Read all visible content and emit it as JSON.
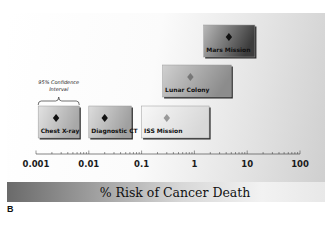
{
  "chart_data": {
    "type": "range-plot",
    "title": "% Risk of Cancer Death",
    "xlabel": "% Risk of Cancer Death",
    "ylabel": "",
    "xscale": "log",
    "xlim": [
      0.001,
      100
    ],
    "xticks": [
      {
        "value": 0.001,
        "label": "0.001"
      },
      {
        "value": 0.01,
        "label": "0.01"
      },
      {
        "value": 0.1,
        "label": "0.1"
      },
      {
        "value": 1,
        "label": "1"
      },
      {
        "value": 10,
        "label": "10"
      },
      {
        "value": 100,
        "label": "100"
      }
    ],
    "grid": false,
    "annotation": {
      "text_line1": "95% Confidence",
      "text_line2": "Interval",
      "applies_to": "Chest X-ray"
    },
    "series": [
      {
        "name": "Chest X-ray",
        "estimate": 0.0024,
        "ci_low": 0.0011,
        "ci_high": 0.0066,
        "row": 0,
        "fill_left": "#e2e2e2",
        "fill_right": "#a8a8a8",
        "marker_color": "#111111",
        "label_color": "#111111"
      },
      {
        "name": "Diagnostic CT",
        "estimate": 0.02,
        "ci_low": 0.01,
        "ci_high": 0.064,
        "row": 0,
        "fill_left": "#dcdcdc",
        "fill_right": "#a0a0a0",
        "marker_color": "#111111",
        "label_color": "#111111"
      },
      {
        "name": "ISS Mission",
        "estimate": 0.3,
        "ci_low": 0.1,
        "ci_high": 1.9,
        "row": 0,
        "fill_left": "#f8f8f8",
        "fill_right": "#d8d8d8",
        "marker_color": "#999999",
        "label_color": "#111111"
      },
      {
        "name": "Lunar Colony",
        "estimate": 0.84,
        "ci_low": 0.25,
        "ci_high": 5,
        "row": 1,
        "fill_left": "#d0d0d0",
        "fill_right": "#8c8c8c",
        "marker_color": "#777777",
        "label_color": "#111111"
      },
      {
        "name": "Mars Mission",
        "estimate": 4.5,
        "ci_low": 1.5,
        "ci_high": 14,
        "row": 2,
        "fill_left": "#b8b8b8",
        "fill_right": "#3c3c3c",
        "marker_color": "#111111",
        "label_color": "#111111"
      }
    ]
  },
  "panel_letter": "B"
}
